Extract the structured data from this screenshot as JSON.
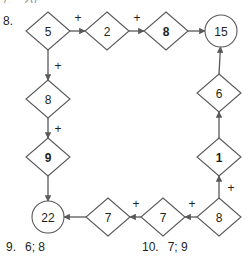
{
  "meta": {
    "background_color": "#ffffff",
    "ink_color": "#231f20",
    "line_color": "#58595b"
  },
  "cutoff_line": {
    "number": "7.",
    "value": "20"
  },
  "exercise": {
    "number": "8."
  },
  "chart_data": {
    "type": "diagram",
    "title": "",
    "nodes": [
      {
        "id": "n5",
        "label": "5",
        "shape": "diamond",
        "bold": false,
        "x": 48,
        "y": 31
      },
      {
        "id": "n2",
        "label": "2",
        "shape": "diamond",
        "bold": false,
        "x": 107,
        "y": 31
      },
      {
        "id": "n8t",
        "label": "8",
        "shape": "diamond",
        "bold": true,
        "x": 166,
        "y": 31
      },
      {
        "id": "n15",
        "label": "15",
        "shape": "circle",
        "bold": false,
        "x": 221,
        "y": 31
      },
      {
        "id": "n8l",
        "label": "8",
        "shape": "diamond",
        "bold": false,
        "x": 48,
        "y": 99
      },
      {
        "id": "n9",
        "label": "9",
        "shape": "diamond",
        "bold": true,
        "x": 48,
        "y": 157
      },
      {
        "id": "n22",
        "label": "22",
        "shape": "circle",
        "bold": false,
        "x": 48,
        "y": 217
      },
      {
        "id": "n7a",
        "label": "7",
        "shape": "diamond",
        "bold": false,
        "x": 108,
        "y": 217
      },
      {
        "id": "n7b",
        "label": "7",
        "shape": "diamond",
        "bold": false,
        "x": 163,
        "y": 217
      },
      {
        "id": "n8b",
        "label": "8",
        "shape": "diamond",
        "bold": false,
        "x": 219,
        "y": 217
      },
      {
        "id": "n1",
        "label": "1",
        "shape": "diamond",
        "bold": true,
        "x": 219,
        "y": 157
      },
      {
        "id": "n6",
        "label": "6",
        "shape": "diamond",
        "bold": false,
        "x": 219,
        "y": 93
      }
    ],
    "edges": [
      {
        "from": "n5",
        "to": "n2",
        "op": "+",
        "op_x": 78,
        "op_y": 18
      },
      {
        "from": "n2",
        "to": "n8t",
        "op": "+",
        "op_x": 137,
        "op_y": 18
      },
      {
        "from": "n8t",
        "to": "n15",
        "op": "",
        "op_x": 0,
        "op_y": 0
      },
      {
        "from": "n5",
        "to": "n8l",
        "op": "+",
        "op_x": 58,
        "op_y": 66
      },
      {
        "from": "n8l",
        "to": "n9",
        "op": "+",
        "op_x": 58,
        "op_y": 129
      },
      {
        "from": "n9",
        "to": "n22",
        "op": "",
        "op_x": 0,
        "op_y": 0
      },
      {
        "from": "n7a",
        "to": "n22",
        "op": "",
        "op_x": 0,
        "op_y": 0
      },
      {
        "from": "n7b",
        "to": "n7a",
        "op": "+",
        "op_x": 136,
        "op_y": 204
      },
      {
        "from": "n8b",
        "to": "n7b",
        "op": "+",
        "op_x": 192,
        "op_y": 204
      },
      {
        "from": "n8b",
        "to": "n1",
        "op": "+",
        "op_x": 231,
        "op_y": 188
      },
      {
        "from": "n1",
        "to": "n6",
        "op": "",
        "op_x": 0,
        "op_y": 0
      },
      {
        "from": "n6",
        "to": "n15",
        "op": "",
        "op_x": 0,
        "op_y": 0
      }
    ],
    "operator_symbol": "+"
  },
  "answers": [
    {
      "number": "9.",
      "value": "6; 8"
    },
    {
      "number": "10.",
      "value": "7; 9"
    }
  ]
}
